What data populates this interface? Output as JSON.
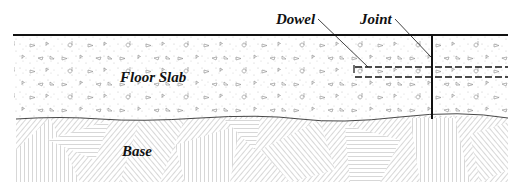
{
  "diagram": {
    "type": "cross-section",
    "labels": {
      "dowel": "Dowel",
      "joint": "Joint",
      "slab": "Floor Slab",
      "base": "Base"
    },
    "layers": [
      {
        "name": "Floor Slab",
        "pattern": "stippled-concrete"
      },
      {
        "name": "Base",
        "pattern": "hatched-aggregate"
      }
    ],
    "elements": [
      {
        "name": "Joint",
        "kind": "vertical-line"
      },
      {
        "name": "Dowel",
        "kind": "dashed-bar"
      }
    ],
    "colors": {
      "line": "#111111",
      "hatch": "#6a6a6a",
      "stipple": "#b8b8b8",
      "background": "#ffffff"
    }
  }
}
